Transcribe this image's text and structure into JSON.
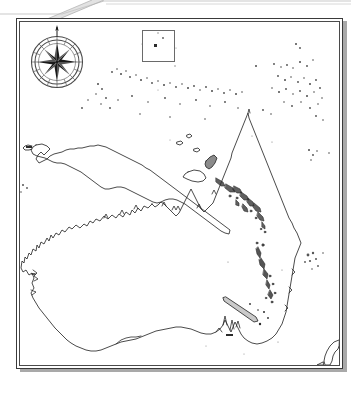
{
  "document": {
    "kind": "scanned-blank-outline-map",
    "title": "Oceania outline map",
    "paper_color": "#ffffff",
    "ink_color": "#2b2b2b",
    "shadow_color": "#a9a9a9",
    "frame_color": "#3a3a3a",
    "scan_artifact": "diagonal-page-fold-band-top"
  },
  "frame": {
    "style": "double-ruled-rectangle",
    "drop_shadow": true,
    "x": 16,
    "y": 18,
    "width": 327,
    "height": 351
  },
  "compass_rose": {
    "name": "compass-rose",
    "points": 8,
    "north_needle": true,
    "rings": 2,
    "spokes": 16,
    "label": ""
  },
  "inset": {
    "name": "inset-locator-box",
    "label": "",
    "x": 142,
    "y": 30,
    "width": 33,
    "height": 32
  },
  "features": {
    "landmasses": [
      {
        "id": "australia",
        "label": "",
        "type": "continent"
      },
      {
        "id": "new-guinea",
        "label": "",
        "type": "large-island"
      },
      {
        "id": "new-britain",
        "label": "",
        "type": "island"
      },
      {
        "id": "new-ireland",
        "label": "",
        "type": "island"
      },
      {
        "id": "new-caledonia",
        "label": "",
        "type": "island"
      },
      {
        "id": "new-zealand-north",
        "label": "",
        "type": "island-partial"
      },
      {
        "id": "tasmania-absent",
        "label": "",
        "type": "none"
      }
    ],
    "archipelagos": [
      {
        "id": "solomon-islands",
        "label": "",
        "orientation": "NW-SE"
      },
      {
        "id": "vanuatu",
        "label": "",
        "orientation": "N-S"
      },
      {
        "id": "caroline-islands",
        "label": "",
        "orientation": "E-W"
      },
      {
        "id": "marshall-islands",
        "label": "",
        "orientation": "scattered"
      },
      {
        "id": "fiji",
        "label": "",
        "orientation": "scattered"
      },
      {
        "id": "lesser-sunda-islands",
        "label": "",
        "orientation": "E-W"
      }
    ]
  },
  "annotations": {
    "grid": false,
    "graticule": false,
    "place_labels": [],
    "legend": null,
    "scale_bar": null
  }
}
